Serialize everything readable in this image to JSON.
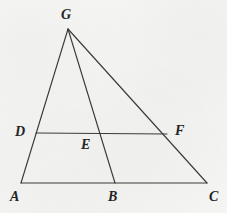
{
  "figure": {
    "kind": "geometry-diagram",
    "background_color": "#f4f4f2",
    "stroke_color": "#3a3a3a",
    "label_color": "#242424",
    "canvas": {
      "width": 227,
      "height": 213
    },
    "points": [
      {
        "name": "G",
        "label": "G",
        "x": 68,
        "y": 29,
        "label_x": 61,
        "label_y": 8
      },
      {
        "name": "D",
        "label": "D",
        "x": 36,
        "y": 133,
        "label_x": 15,
        "label_y": 125
      },
      {
        "name": "E",
        "label": "E",
        "x": 104,
        "y": 133,
        "label_x": 81,
        "label_y": 138
      },
      {
        "name": "F",
        "label": "F",
        "x": 167,
        "y": 134,
        "label_x": 175,
        "label_y": 124
      },
      {
        "name": "A",
        "label": "A",
        "x": 21,
        "y": 183,
        "label_x": 10,
        "label_y": 190
      },
      {
        "name": "B",
        "label": "B",
        "x": 115,
        "y": 183,
        "label_x": 108,
        "label_y": 190
      },
      {
        "name": "C",
        "label": "C",
        "x": 207,
        "y": 183,
        "label_x": 209,
        "label_y": 190
      }
    ],
    "segments": [
      {
        "name": "segment-GA",
        "from": "G",
        "to": "A"
      },
      {
        "name": "segment-GB",
        "from": "G",
        "to": "B"
      },
      {
        "name": "segment-GC",
        "from": "G",
        "to": "C"
      },
      {
        "name": "segment-AC",
        "from": "A",
        "to": "C"
      },
      {
        "name": "segment-DF",
        "from": "D",
        "to": "F"
      }
    ]
  }
}
